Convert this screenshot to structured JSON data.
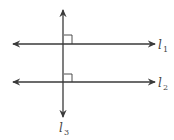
{
  "diagram": {
    "line_color": "#3a3a3a",
    "lines": [
      {
        "id": "l1",
        "label_main": "l",
        "label_sub": "1",
        "orientation": "horizontal",
        "y": 44
      },
      {
        "id": "l2",
        "label_main": "l",
        "label_sub": "2",
        "orientation": "horizontal",
        "y": 82
      },
      {
        "id": "l3",
        "label_main": "l",
        "label_sub": "3",
        "orientation": "vertical",
        "x": 63
      }
    ],
    "right_angle_marks": [
      {
        "at": "l1-l3"
      },
      {
        "at": "l2-l3"
      }
    ]
  }
}
